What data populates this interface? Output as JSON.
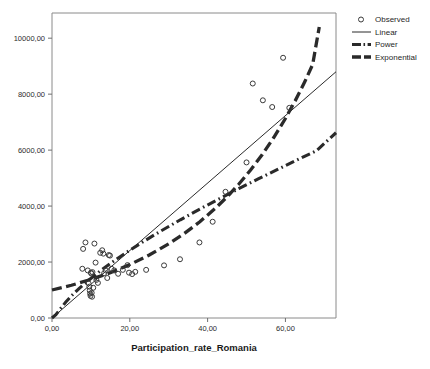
{
  "chart_data": {
    "type": "scatter",
    "title": "",
    "xlabel": "Participation_rate_Romania",
    "ylabel": "",
    "xlim": [
      0,
      73
    ],
    "ylim": [
      0,
      10900
    ],
    "grid": false,
    "legend_position": "right",
    "xticks": [
      "0,00",
      "20,00",
      "40,00",
      "60,00"
    ],
    "xtick_values": [
      0,
      20,
      40,
      60
    ],
    "yticks": [
      "0,00",
      "2000,00",
      "4000,00",
      "6000,00",
      "8000,00",
      "10000,00"
    ],
    "ytick_values": [
      0,
      2000,
      4000,
      6000,
      8000,
      10000
    ],
    "series": [
      {
        "name": "Observed",
        "type": "scatter",
        "marker": "open-circle",
        "points": [
          [
            7.8,
            1760
          ],
          [
            8.0,
            2470
          ],
          [
            8.6,
            2700
          ],
          [
            9.2,
            1700
          ],
          [
            9.4,
            1240
          ],
          [
            9.6,
            1120
          ],
          [
            9.7,
            980
          ],
          [
            9.8,
            870
          ],
          [
            9.9,
            790
          ],
          [
            10.0,
            1620
          ],
          [
            10.1,
            1590
          ],
          [
            10.2,
            900
          ],
          [
            10.3,
            760
          ],
          [
            10.4,
            1640
          ],
          [
            10.6,
            1080
          ],
          [
            10.9,
            2660
          ],
          [
            11.2,
            1980
          ],
          [
            11.4,
            1360
          ],
          [
            11.8,
            1255
          ],
          [
            12.4,
            2330
          ],
          [
            12.9,
            2420
          ],
          [
            13.2,
            2300
          ],
          [
            13.4,
            1600
          ],
          [
            13.8,
            1700
          ],
          [
            14.2,
            1430
          ],
          [
            14.6,
            2250
          ],
          [
            14.9,
            2230
          ],
          [
            15.3,
            1760
          ],
          [
            16.0,
            1700
          ],
          [
            17.0,
            1580
          ],
          [
            18.2,
            1720
          ],
          [
            19.4,
            1890
          ],
          [
            19.8,
            1620
          ],
          [
            20.6,
            1570
          ],
          [
            21.4,
            1650
          ],
          [
            24.2,
            1720
          ],
          [
            28.8,
            1880
          ],
          [
            32.9,
            2100
          ],
          [
            37.9,
            2700
          ],
          [
            41.3,
            3440
          ],
          [
            44.6,
            4510
          ],
          [
            50.0,
            5560
          ],
          [
            51.6,
            8380
          ],
          [
            54.2,
            7780
          ],
          [
            56.6,
            7540
          ],
          [
            59.4,
            9300
          ],
          [
            61.0,
            7510
          ]
        ]
      },
      {
        "name": "Linear",
        "type": "line",
        "style": "solid",
        "equation_points": [
          [
            0,
            0
          ],
          [
            73,
            8800
          ]
        ]
      },
      {
        "name": "Power",
        "type": "line",
        "style": "dash-dot",
        "equation_points": [
          [
            0.0,
            0
          ],
          [
            1.0,
            120
          ],
          [
            2.0,
            300
          ],
          [
            3.5,
            560
          ],
          [
            5.0,
            790
          ],
          [
            7.0,
            1060
          ],
          [
            9.0,
            1300
          ],
          [
            12.0,
            1640
          ],
          [
            15.0,
            1950
          ],
          [
            19.0,
            2330
          ],
          [
            23.0,
            2690
          ],
          [
            28.0,
            3110
          ],
          [
            33.0,
            3510
          ],
          [
            38.0,
            3890
          ],
          [
            43.0,
            4260
          ],
          [
            48.0,
            4620
          ],
          [
            53.0,
            4970
          ],
          [
            58.0,
            5310
          ],
          [
            63.0,
            5650
          ],
          [
            68.0,
            5980
          ],
          [
            73.0,
            6620
          ]
        ]
      },
      {
        "name": "Exponential",
        "type": "line",
        "style": "dashed",
        "equation_points": [
          [
            0.0,
            1000
          ],
          [
            5.0,
            1170
          ],
          [
            10.0,
            1380
          ],
          [
            15.0,
            1620
          ],
          [
            20.0,
            1910
          ],
          [
            25.0,
            2250
          ],
          [
            30.0,
            2650
          ],
          [
            34.0,
            3020
          ],
          [
            38.0,
            3440
          ],
          [
            42.0,
            3920
          ],
          [
            45.0,
            4330
          ],
          [
            48.0,
            4780
          ],
          [
            51.0,
            5280
          ],
          [
            54.0,
            5830
          ],
          [
            57.0,
            6450
          ],
          [
            60.0,
            7130
          ],
          [
            62.5,
            7760
          ],
          [
            65.0,
            8450
          ],
          [
            67.0,
            9060
          ],
          [
            68.7,
            10400
          ]
        ]
      }
    ]
  },
  "legend": {
    "items": [
      {
        "label": "Observed",
        "marker": "open-circle"
      },
      {
        "label": "Linear",
        "marker": "solid-line"
      },
      {
        "label": "Power",
        "marker": "dash-dot-line"
      },
      {
        "label": "Exponential",
        "marker": "dashed-line"
      }
    ]
  },
  "axes": {
    "x_title": "Participation_rate_Romania"
  }
}
